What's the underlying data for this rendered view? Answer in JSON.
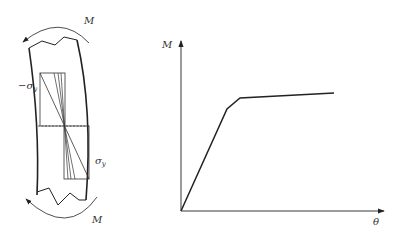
{
  "left_figure": {
    "moment_label_top": "M",
    "moment_label_bottom": "M",
    "stress_label_neg": "−σ",
    "stress_label_neg_sub": "y",
    "stress_label_pos": "σ",
    "stress_label_pos_sub": "y"
  },
  "chart_data": {
    "type": "line",
    "title": "",
    "xlabel": "θ",
    "ylabel": "M",
    "grid": false,
    "legend": null,
    "series": [
      {
        "name": "M-θ curve",
        "points_px": [
          [
            181,
            211
          ],
          [
            227,
            109
          ],
          [
            240,
            98
          ],
          [
            334,
            93
          ]
        ],
        "x_normalized": [
          0,
          0.23,
          0.29,
          0.76
        ],
        "y_normalized": [
          0,
          0.6,
          0.67,
          0.7
        ]
      }
    ]
  },
  "colors": {
    "line": "#222222",
    "text": "#333333",
    "background": "#ffffff"
  }
}
